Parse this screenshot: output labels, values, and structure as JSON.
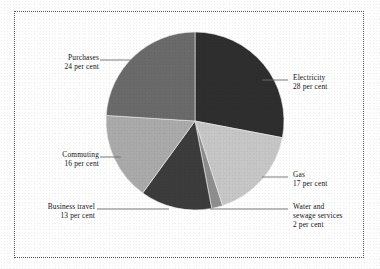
{
  "figure": {
    "background_color": "#fefefe",
    "border_style": "dotted",
    "border_color": "#555555"
  },
  "chart_data": {
    "type": "pie",
    "title": "",
    "subtitle": "",
    "xlabel": "",
    "ylabel": "",
    "grid": false,
    "legend_position": "callout-labels",
    "units": "per cent",
    "start_angle_deg": 0,
    "direction": "clockwise",
    "center": {
      "x": 195,
      "y": 121
    },
    "radius": 89,
    "categories": [
      "Electricity",
      "Gas",
      "Water and sewage services",
      "Business travel",
      "Commuting",
      "Purchases"
    ],
    "values": [
      28,
      17,
      2,
      13,
      16,
      24
    ],
    "colors": [
      "#2e2e2e",
      "#c6c6c6",
      "#8e8e8e",
      "#3c3c3c",
      "#aaaaaa",
      "#6a6a6a"
    ],
    "slices": [
      {
        "name": "Electricity",
        "value": 28,
        "color": "#2e2e2e",
        "label_lines": [
          "Electricity",
          "28 per cent"
        ],
        "label_side": "right"
      },
      {
        "name": "Gas",
        "value": 17,
        "color": "#c6c6c6",
        "label_lines": [
          "Gas",
          "17 per cent"
        ],
        "label_side": "right"
      },
      {
        "name": "Water and sewage services",
        "value": 2,
        "color": "#8e8e8e",
        "label_lines": [
          "Water and",
          "sewage services",
          "2 per cent"
        ],
        "label_side": "right"
      },
      {
        "name": "Business travel",
        "value": 13,
        "color": "#3c3c3c",
        "label_lines": [
          "Business travel",
          "13 per cent"
        ],
        "label_side": "left"
      },
      {
        "name": "Commuting",
        "value": 16,
        "color": "#aaaaaa",
        "label_lines": [
          "Commuting",
          "16 per cent"
        ],
        "label_side": "left"
      },
      {
        "name": "Purchases",
        "value": 24,
        "color": "#6a6a6a",
        "label_lines": [
          "Purchases",
          "24 per cent"
        ],
        "label_side": "left"
      }
    ]
  },
  "labels": {
    "purchases": {
      "line1": "Purchases",
      "line2": "24 per cent"
    },
    "commuting": {
      "line1": "Commuting",
      "line2": "16 per cent"
    },
    "business": {
      "line1": "Business travel",
      "line2": "13 per cent"
    },
    "electricity": {
      "line1": "Electricity",
      "line2": "28 per cent"
    },
    "gas": {
      "line1": "Gas",
      "line2": "17 per cent"
    },
    "water": {
      "line1": "Water and",
      "line2": "sewage services",
      "line3": "2 per cent"
    }
  }
}
